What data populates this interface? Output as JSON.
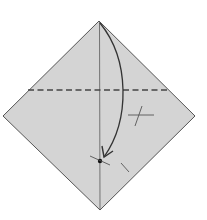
{
  "diagram": {
    "type": "origami-step",
    "paper": {
      "fill": "#d4d4d4",
      "stroke": "#555555"
    },
    "square": {
      "top": [
        99,
        21
      ],
      "right": [
        195,
        116
      ],
      "bottom": [
        100,
        210
      ],
      "left": [
        3,
        116
      ]
    },
    "fold_line": {
      "style": "valley-dashed",
      "from": [
        28,
        90
      ],
      "to": [
        170,
        90
      ]
    },
    "center_crease": {
      "from": [
        99,
        21
      ],
      "to": [
        100,
        210
      ]
    },
    "target_point": [
      100,
      161
    ],
    "arrow": {
      "direction": "fold-top-corner-down-to-point"
    },
    "marks": [
      "equal-length-mark-upper",
      "equal-length-mark-lower"
    ]
  }
}
